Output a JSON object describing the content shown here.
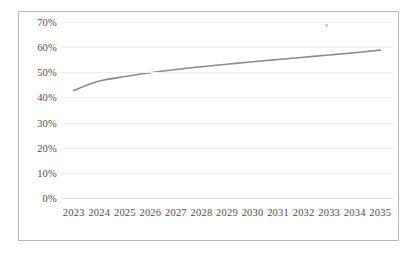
{
  "chart_data": {
    "type": "line",
    "title": "",
    "subtitle": "",
    "xlabel": "",
    "ylabel": "",
    "categories": [
      "2023",
      "2024",
      "2025",
      "2026",
      "2027",
      "2028",
      "2029",
      "2030",
      "2031",
      "2032",
      "2033",
      "2034",
      "2035"
    ],
    "values": [
      42.8,
      46.5,
      48.3,
      49.8,
      51.1,
      52.2,
      53.2,
      54.2,
      55.1,
      56.0,
      56.9,
      57.8,
      58.8
    ],
    "value_suffix": "%",
    "ylim": [
      0,
      70
    ],
    "y_ticks": [
      "0%",
      "10%",
      "20%",
      "30%",
      "40%",
      "50%",
      "60%",
      "70%"
    ],
    "y_tick_values": [
      0,
      10,
      20,
      30,
      40,
      50,
      60,
      70
    ],
    "grid": true,
    "legend": false,
    "legend_position": "none",
    "series": [
      {
        "name": "",
        "color": "#8c8c8c",
        "values": [
          42.8,
          46.5,
          48.3,
          49.8,
          51.1,
          52.2,
          53.2,
          54.2,
          55.1,
          56.0,
          56.9,
          57.8,
          58.8
        ]
      }
    ],
    "annotations": []
  },
  "style": {
    "line_color": "#8c8c8c",
    "grid_color": "#ededed",
    "border_color": "#b9b9b9",
    "text_color": "#4d4d4d",
    "background": "#ffffff"
  }
}
